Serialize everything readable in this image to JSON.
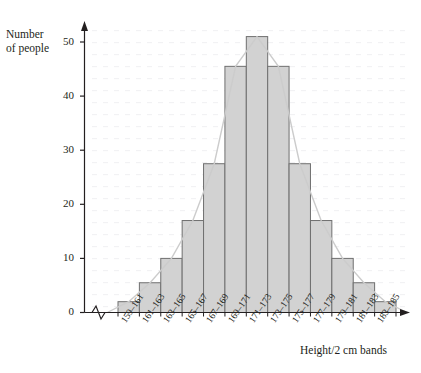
{
  "figure": {
    "ghost_text_top": "",
    "y_axis_title_line1": "Number",
    "y_axis_title_line2": "of people",
    "x_axis_title": "Height/2 cm bands",
    "axis_break_marker": "zigzag-break"
  },
  "chart_data": {
    "type": "bar",
    "title": "",
    "xlabel": "Height/2 cm bands",
    "ylabel": "Number of people",
    "categories": [
      "159–161",
      "161–163",
      "163–165",
      "165–167",
      "167–169",
      "169–171",
      "171–173",
      "173–175",
      "175–177",
      "177–179",
      "179–181",
      "181–183",
      "183–185"
    ],
    "values": [
      2,
      5.5,
      10,
      17,
      27.5,
      45.5,
      51,
      45.5,
      27.5,
      17,
      10,
      5.5,
      2
    ],
    "ylim": [
      0,
      53
    ],
    "yticks": [
      0,
      10,
      20,
      30,
      40,
      50
    ],
    "ytick_labels": [
      "0",
      "10",
      "20",
      "30",
      "40",
      "50"
    ],
    "grid": "faint-dotted",
    "legend": "none",
    "overlay": {
      "name": "frequency-polygon",
      "type": "line",
      "color": "#c9c9c9"
    },
    "colors": {
      "bar_fill": "#d2d2d2",
      "bar_stroke": "#6f6f6f",
      "axis": "#231f20",
      "grid": "#f2f2f4",
      "polygon": "#cccccc"
    }
  }
}
